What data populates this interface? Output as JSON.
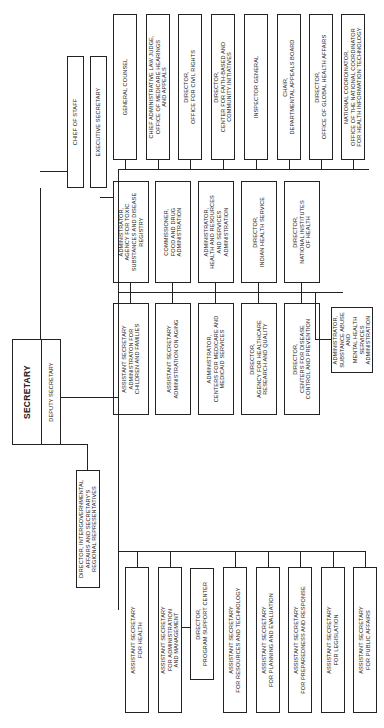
{
  "chart_data": {
    "type": "org-chart",
    "orientation": "rotated-90-ccw",
    "root": {
      "title": "SECRETARY",
      "subtitle": "DEPUTY SECRETARY"
    },
    "immediate_office": [
      "CHIEF OF STAFF",
      "EXECUTIVE SECRETARY"
    ],
    "intergovernmental": "DIRECTOR, INTERGOVERNMENTAL AFFAIRS AND SECRETARY'S REGIONAL REPRESENTATIVES",
    "staff_offices": [
      "GENERAL COUNSEL",
      "CHIEF ADMINISTRATIVE LAW JUDGE, OFFICE OF MEDICARE HEARINGS AND APPEALS",
      "DIRECTOR, OFFICE FOR CIVIL RIGHTS",
      "DIRECTOR, CENTER FOR FAITH-BASED AND COMMUNITY INITIATIVES",
      "INSPECTOR GENERAL",
      "CHAIR, DEPARTMENTAL APPEALS BOARD",
      "DIRECTOR, OFFICE OF GLOBAL HEALTH AFFAIRS",
      "NATIONAL COORDINATOR, OFFICE OF THE NATIONAL COORDINATOR FOR HEALTH INFORMATION TECHNOLOGY"
    ],
    "operating_divisions_upper": [
      "ADMINISTRATOR, AGENCY FOR TOXIC SUBSTANCES AND DISEASE REGISTRY",
      "COMMISSIONER, FOOD AND DRUG ADMINISTRATION",
      "ADMINISTRATOR, HEALTH AND RESOURCES AND SERVICES ADMINISTRATION",
      "DIRECTOR, INDIAN HEALTH SERVICE",
      "DIRECTOR, NATIONAL INSTITUTES OF HEALTH"
    ],
    "operating_divisions_lower": [
      "ASSISTANT SECRETARY ADMINISTRATION FOR CHILDREN AND FAMILIES",
      "ASSISTANT SECRETARY ADMINISTRATION ON AGING",
      "ADMINISTRATOR, CENTERS FOR MEDICARE AND MEDICAID SERVICES",
      "DIRECTOR, AGENCY FOR HEALTHCARE RESEARCH AND QUALITY",
      "DIRECTOR, CENTERS FOR DISEASE CONTROL AND PREVENTION"
    ],
    "operating_division_center": "ADMINISTRATOR, SUBSTANCE ABUSE AND MENTAL HEALTH SERVICES ADMINISTRATION",
    "assistant_secretaries": [
      "ASSISTANT SECRETARY FOR HEALTH",
      "ASSISTANT SECRETARY FOR ADMINISTRATION AND MANAGEMENT",
      "ASSISTANT SECRETARY FOR RESOURCES AND TECHNOLOGY",
      "ASSISTANT SECRETARY FOR PLANNING AND EVALUATION",
      "ASSISTANT SECRETARY FOR PREPAREDNESS AND RESPONSE",
      "ASSISTANT SECRETARY FOR LEGISLATION",
      "ASSISTANT SECRETARY FOR PUBLIC AFFAIRS"
    ],
    "sub_office": "DIRECTOR, PROGRAM SUPPORT CENTER"
  },
  "root": {
    "title": "SECRETARY",
    "subtitle": "DEPUTY SECRETARY"
  },
  "office": {
    "chief": "CHIEF OF STAFF",
    "exec": "EXECUTIVE SECRETARY"
  },
  "intergov": "DIRECTOR, INTERGOVERNMENTAL\nAFFAIRS AND SECRETARY'S\nREGIONAL REPRESENTATIVES",
  "staff": [
    "GENERAL COUNSEL",
    "CHIEF ADMINISTRATIVE LAW JUDGE,\nOFFICE OF MEDICARE HEARINGS\nAND APPEALS",
    "DIRECTOR,\nOFFICE FOR CIVIL RIGHTS",
    "DIRECTOR,\nCENTER FOR FAITH-BASED AND\nCOMMUNITY INITIATIVES",
    "INSPECTOR GENERAL",
    "CHAIR,\nDEPARTMENTAL APPEALS BOARD",
    "DIRECTOR,\nOFFICE OF GLOBAL HEALTH AFFAIRS",
    "NATIONAL COORDINATOR,\nOFFICE OF THE NATIONAL COORDINATOR\nFOR HEALTH INFORMATION TECHNOLOGY"
  ],
  "upper": [
    "ADMINISTRATOR,\nAGENCY FOR TOXIC\nSUBSTANCES AND DISEASE\nREGISTRY",
    "COMMISSIONER,\nFOOD AND DRUG\nADMINISTRATION",
    "ADMINISTRATOR,\nHEALTH AND RESOURCES\nAND SERVICES\nADMINISTRATION",
    "DIRECTOR,\nINDIAN HEALTH SERVICE",
    "DIRECTOR,\nNATIONAL INSTITUTES\nOF HEALTH"
  ],
  "lower": [
    "ASSISTANT SECRETARY\nADMINISTRATON FOR\nCHILDREN AND FAMILIES",
    "ASSISTANT SECRETARY\nADMINISTRATION ON AGING",
    "ADMINISTRATOR,\nCENTERS FOR MEDICARE AND\nMEDICAID SERVICES",
    "DIRECTOR,\nAGENCY FOR HEALTHCARE\nRESEARCH AND QUALITY",
    "DIRECTOR,\nCENTERS FOR DISEASE\nCONTROL AND PREVENTION"
  ],
  "samhsa": "ADMINISTRATOR,\nSUBSTANCE ABUSE AND\nMENTAL HEALTH SERVICES\nADMINISTRATION",
  "asst": [
    "ASSISTANT SECRETARY\nFOR HEALTH",
    "ASSISTANT SECRETARY\nFOR ADMINISTRATION\nAND MANAGEMENT",
    "ASSISTANT SECRETARY\nFOR RESOURCES AND TECHNOLOGY",
    "ASSISTANT SECRETARY\nFOR PLANNING AND EVALUATION",
    "ASSISTANT SECRETARY\nFOR PREPAREDNESS AND RESPONSE",
    "ASSISTANT SECRETARY\nFOR LEGISLATION",
    "ASSISTANT SECRETARY\nFOR PUBLIC AFFAIRS"
  ],
  "psc": "DIRECTOR,\nPROGRAM SUPPORT CENTER"
}
